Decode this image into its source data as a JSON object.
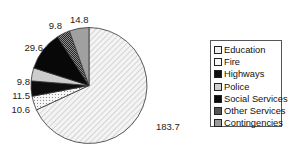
{
  "chart_data": {
    "type": "pie",
    "title": "",
    "categories": [
      "Education",
      "Fire",
      "Highways",
      "Police",
      "Social Services",
      "Other Services",
      "Contingencies"
    ],
    "values": [
      183.7,
      10.6,
      11.5,
      9.8,
      29.6,
      9.8,
      14.8
    ],
    "data_labels": [
      "183.7",
      "10.6",
      "11.5",
      "9.8",
      "29.6",
      "9.8",
      "14.8"
    ],
    "start_angle": "12 o'clock",
    "direction": "clockwise",
    "legend_position": "right",
    "grid": false
  },
  "legend": {
    "items": [
      {
        "label": "Education",
        "swatch": "#efefef"
      },
      {
        "label": "Fire",
        "swatch": "#f8f8f8"
      },
      {
        "label": "Highways",
        "swatch": "#111111"
      },
      {
        "label": "Police",
        "swatch": "#cfcfcf"
      },
      {
        "label": "Social Services",
        "swatch": "#0a0a0a"
      },
      {
        "label": "Other Services",
        "swatch": "#555555"
      },
      {
        "label": "Contingencies",
        "swatch": "#9a9a9a"
      }
    ]
  },
  "slice_styles": [
    {
      "fill": "url(#hatchEdu)"
    },
    {
      "fill": "url(#dotsFire)"
    },
    {
      "fill": "#0d0d0d"
    },
    {
      "fill": "#cdcdcd"
    },
    {
      "fill": "#080808"
    },
    {
      "fill": "url(#checkOther)"
    },
    {
      "fill": "#a0a0a0"
    }
  ]
}
